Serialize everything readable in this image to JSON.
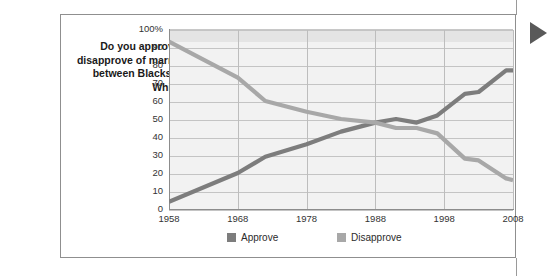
{
  "card": {
    "question": "Do you approve or disapprove of marriage between Blacks and Whites?"
  },
  "marker": {
    "icon": "play-triangle-right-icon",
    "color": "#595959"
  },
  "colors": {
    "approve": "#7d7d7d",
    "disapprove": "#a8a8a8",
    "plot_background": "#f2f2f2",
    "gridline": "#c4c4c4",
    "axis": "#8c8c8c",
    "border": "#8f8f8f"
  },
  "legend": {
    "approve_label": "Approve",
    "disapprove_label": "Disapprove"
  },
  "chart_data": {
    "type": "line",
    "title": "Do you approve or disapprove of marriage between Blacks and Whites?",
    "xlabel": "",
    "ylabel": "",
    "xlim": [
      1958,
      2008
    ],
    "ylim": [
      0,
      100
    ],
    "grid": true,
    "legend_position": "bottom",
    "x_ticks": [
      1958,
      1968,
      1978,
      1988,
      1998,
      2008
    ],
    "x_tick_labels": [
      "1958",
      "1968",
      "1978",
      "1988",
      "1998",
      "2008"
    ],
    "y_ticks": [
      0,
      10,
      20,
      30,
      40,
      50,
      60,
      70,
      80,
      90,
      100
    ],
    "y_tick_labels": [
      "0",
      "10",
      "20",
      "30",
      "40",
      "50",
      "60",
      "70",
      "80",
      "90",
      "100%"
    ],
    "series": [
      {
        "name": "Approve",
        "color": "#7d7d7d",
        "x": [
          1958,
          1968,
          1972,
          1978,
          1983,
          1988,
          1991,
          1994,
          1997,
          2001,
          2003,
          2007,
          2008
        ],
        "values": [
          4,
          20,
          29,
          36,
          43,
          48,
          50,
          48,
          52,
          64,
          65,
          77,
          77
        ]
      },
      {
        "name": "Disapprove",
        "color": "#a8a8a8",
        "x": [
          1958,
          1968,
          1972,
          1978,
          1983,
          1988,
          1991,
          1994,
          1997,
          2001,
          2003,
          2007,
          2008
        ],
        "values": [
          93,
          73,
          60,
          54,
          50,
          48,
          45,
          45,
          42,
          28,
          27,
          17,
          16
        ]
      }
    ]
  }
}
